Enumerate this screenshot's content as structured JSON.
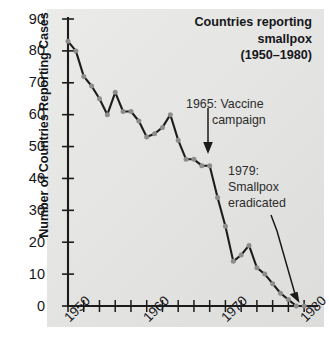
{
  "chart_data": {
    "type": "line",
    "title_lines": [
      "Countries reporting",
      "smallpox",
      "(1950–1980)"
    ],
    "xlabel": "",
    "ylabel": "Number of Countries Reporting Cases",
    "xlim": [
      1950,
      1981
    ],
    "ylim": [
      0,
      90
    ],
    "grid": false,
    "legend": "none",
    "y_ticks": [
      0,
      10,
      20,
      30,
      40,
      50,
      60,
      70,
      80,
      90
    ],
    "y_tick_labels": [
      "0",
      "10",
      "20",
      "30",
      "40",
      "50",
      "60",
      "70",
      "80",
      "90"
    ],
    "x_ticks": [
      1950,
      1952,
      1954,
      1956,
      1958,
      1960,
      1962,
      1964,
      1966,
      1968,
      1970,
      1972,
      1974,
      1976,
      1978,
      1980
    ],
    "x_tick_labels_shown": [
      "1950",
      "1960",
      "1970",
      "1980"
    ],
    "x_tick_label_positions": [
      1950,
      1960,
      1970,
      1980
    ],
    "x": [
      1950,
      1951,
      1952,
      1953,
      1954,
      1955,
      1956,
      1957,
      1958,
      1959,
      1960,
      1961,
      1962,
      1963,
      1964,
      1965,
      1966,
      1967,
      1968,
      1969,
      1970,
      1971,
      1972,
      1973,
      1974,
      1975,
      1976,
      1977,
      1978,
      1979,
      1980
    ],
    "values": [
      83,
      80,
      72,
      69,
      65,
      60,
      67,
      61,
      61,
      58,
      53,
      54,
      56,
      60,
      52,
      46,
      46,
      44,
      44,
      34,
      25,
      14,
      16,
      19,
      12,
      10,
      7,
      4,
      2,
      0,
      0
    ],
    "series": [
      {
        "name": "Countries reporting smallpox",
        "values": [
          83,
          80,
          72,
          69,
          65,
          60,
          67,
          61,
          61,
          58,
          53,
          54,
          56,
          60,
          52,
          46,
          46,
          44,
          44,
          34,
          25,
          14,
          16,
          19,
          12,
          10,
          7,
          4,
          2,
          0,
          0
        ],
        "line_color": "#1d1d1d",
        "marker_color": "#8d8d8d"
      }
    ],
    "annotations": [
      {
        "id": "vaccine-campaign",
        "lines": [
          "1965: Vaccine",
          "campaign"
        ],
        "text": "1965: Vaccine campaign",
        "arrow": "down",
        "points_to_year": 1968
      },
      {
        "id": "smallpox-eradicated",
        "lines": [
          "1979:",
          "Smallpox",
          "eradicated"
        ],
        "text": "1979: Smallpox eradicated",
        "arrow": "down-right",
        "points_to_year": 1979
      }
    ],
    "colors": {
      "panel_background": "#e4e4e2",
      "page_background": "#ffffff",
      "axis": "#1b1b1b",
      "text": "#15161a",
      "annotation_text": "#2c2c2c"
    }
  }
}
